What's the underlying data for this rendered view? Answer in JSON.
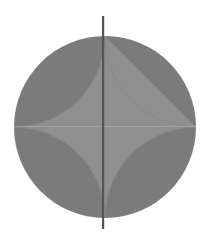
{
  "figure": {
    "circle": {
      "cx": 105,
      "cy": 127,
      "r": 91
    },
    "axis_line": {
      "x": 103,
      "y1": 16,
      "y2": 229
    },
    "colors": {
      "background": "#ffffff",
      "outer_region": "#7b7b7b",
      "inner_star": "#8f8f8f",
      "seam": "#a8a8a8",
      "axis_line": "#555555"
    }
  }
}
